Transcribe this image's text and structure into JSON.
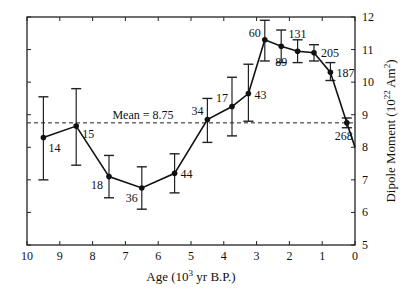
{
  "chart_data": {
    "type": "line",
    "title": "",
    "xlabel": "Age (10^3 yr B.P.)",
    "ylabel": "Dipole Moment (10^22 Am^2)",
    "xlim": [
      10,
      0
    ],
    "ylim": [
      5,
      12
    ],
    "x_ticks": [
      10,
      9,
      8,
      7,
      6,
      5,
      4,
      3,
      2,
      1,
      0
    ],
    "y_ticks": [
      5,
      6,
      7,
      8,
      9,
      10,
      11,
      12
    ],
    "y_axis_position": "right",
    "grid": false,
    "mean_line": {
      "value": 8.75,
      "label": "Mean = 8.75",
      "style": "dashed"
    },
    "series": [
      {
        "name": "Dipole moment",
        "points": [
          {
            "age": 9.5,
            "value": 8.3,
            "low": 7.0,
            "high": 9.55,
            "n": "14"
          },
          {
            "age": 8.5,
            "value": 8.65,
            "low": 7.45,
            "high": 9.8,
            "n": "15"
          },
          {
            "age": 7.5,
            "value": 7.1,
            "low": 6.45,
            "high": 7.75,
            "n": "18"
          },
          {
            "age": 6.5,
            "value": 6.75,
            "low": 6.1,
            "high": 7.4,
            "n": "36"
          },
          {
            "age": 5.5,
            "value": 7.2,
            "low": 6.6,
            "high": 7.8,
            "n": "44"
          },
          {
            "age": 4.5,
            "value": 8.85,
            "low": 8.15,
            "high": 9.5,
            "n": "34"
          },
          {
            "age": 3.75,
            "value": 9.25,
            "low": 8.35,
            "high": 10.15,
            "n": "17"
          },
          {
            "age": 3.25,
            "value": 9.65,
            "low": 8.8,
            "high": 10.55,
            "n": "43"
          },
          {
            "age": 2.75,
            "value": 11.3,
            "low": 10.65,
            "high": 11.9,
            "n": "60"
          },
          {
            "age": 2.25,
            "value": 11.1,
            "low": 10.6,
            "high": 11.6,
            "n": "89"
          },
          {
            "age": 1.75,
            "value": 10.95,
            "low": 10.6,
            "high": 11.3,
            "n": "131"
          },
          {
            "age": 1.25,
            "value": 10.9,
            "low": 10.65,
            "high": 11.15,
            "n": "205"
          },
          {
            "age": 0.75,
            "value": 10.3,
            "low": 10.05,
            "high": 10.6,
            "n": "187"
          },
          {
            "age": 0.25,
            "value": 8.75,
            "low": 8.6,
            "high": 8.9,
            "n": "268"
          }
        ],
        "tail_to": {
          "age": 0.0,
          "value": 8.0
        }
      }
    ]
  }
}
